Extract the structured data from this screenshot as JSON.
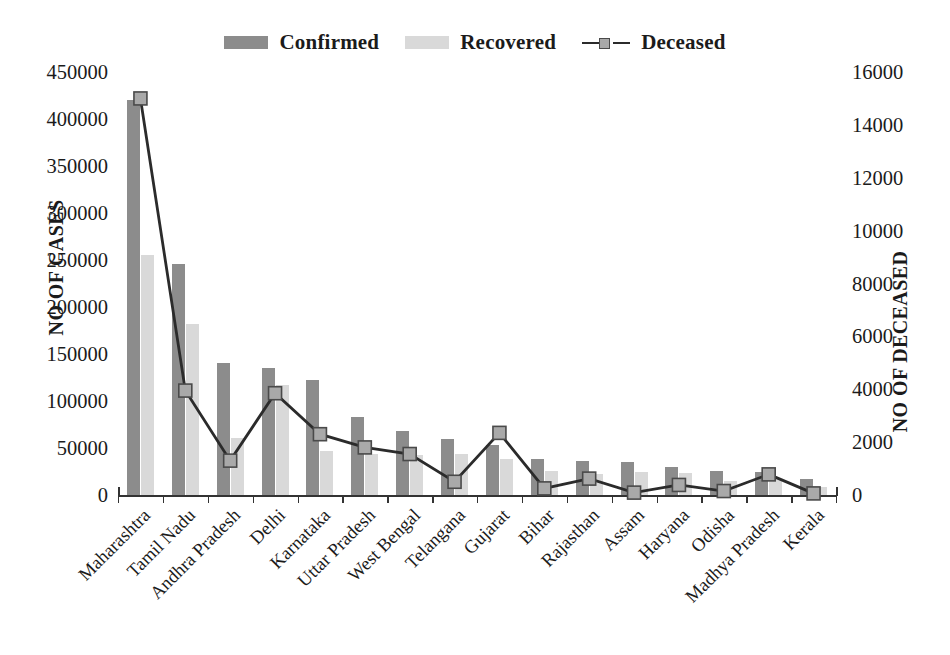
{
  "legend": {
    "items": [
      {
        "label": "Confirmed",
        "marker": "bar-swatch",
        "color": "#8c8c8c"
      },
      {
        "label": "Recovered",
        "marker": "bar-swatch",
        "color": "#d9d9d9"
      },
      {
        "label": "Deceased",
        "marker": "line-marker",
        "color": "#a9a9a9"
      }
    ]
  },
  "chart_data": {
    "type": "bar",
    "title": "",
    "xlabel": "",
    "ylabel": "NO OF CASES",
    "y2label": "NO OF DECEASED",
    "ylim": [
      0,
      450000
    ],
    "y2lim": [
      0,
      16000
    ],
    "grid": false,
    "legend_position": "top-center",
    "yticks": [
      0,
      50000,
      100000,
      150000,
      200000,
      250000,
      300000,
      350000,
      400000,
      450000
    ],
    "ytick_labels": [
      "0",
      "50000",
      "100000",
      "150000",
      "200000",
      "250000",
      "300000",
      "350000",
      "400000",
      "450000"
    ],
    "y2ticks": [
      0,
      2000,
      4000,
      6000,
      8000,
      10000,
      12000,
      14000,
      16000
    ],
    "y2tick_labels": [
      "0",
      "2000",
      "4000",
      "6000",
      "8000",
      "10000",
      "12000",
      "14000",
      "16000"
    ],
    "categories": [
      "Maharashtra",
      "Tamil Nadu",
      "Andhra Pradesh",
      "Delhi",
      "Karnataka",
      "Uttar Pradesh",
      "West Bengal",
      "Telangana",
      "Gujarat",
      "Bihar",
      "Rajasthan",
      "Assam",
      "Haryana",
      "Odisha",
      "Madhya Pradesh",
      "Kerala"
    ],
    "series": [
      {
        "name": "Confirmed",
        "axis": "left",
        "type": "bar",
        "color": "#8c8c8c",
        "values": [
          420000,
          246000,
          140000,
          135000,
          122000,
          83000,
          68000,
          60000,
          53000,
          38000,
          36000,
          35000,
          30000,
          26000,
          25000,
          17000
        ]
      },
      {
        "name": "Recovered",
        "axis": "left",
        "type": "bar",
        "color": "#d9d9d9",
        "values": [
          255000,
          182000,
          61000,
          117000,
          47000,
          44000,
          43000,
          44000,
          38000,
          26000,
          22000,
          24000,
          23000,
          15000,
          17000,
          9000
        ]
      },
      {
        "name": "Deceased",
        "axis": "right",
        "type": "line",
        "color": "#a9a9a9",
        "line_color": "#2b2b2b",
        "values": [
          15000,
          3950,
          1300,
          3850,
          2300,
          1800,
          1550,
          500,
          2350,
          250,
          620,
          90,
          380,
          150,
          780,
          60
        ]
      }
    ]
  }
}
